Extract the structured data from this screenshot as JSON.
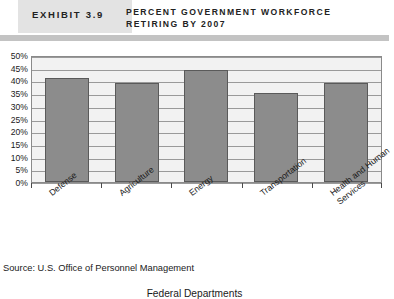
{
  "header": {
    "exhibit_label": "EXHIBIT 3.9",
    "title_line1": "PERCENT GOVERNMENT WORKFORCE",
    "title_line2": "RETIRING BY 2007"
  },
  "source": "Source: U.S. Office of Personnel Management",
  "colors": {
    "bar_fill": "#8c8c8c",
    "bar_border": "#5a5a5a",
    "plot_background": "#f2f2f2",
    "gridline": "#9a9a9a",
    "header_band": "#e3e3e3",
    "header_rule": "#c3c3c3"
  },
  "chart_data": {
    "type": "bar",
    "title": "PERCENT GOVERNMENT WORKFORCE RETIRING BY 2007",
    "categories": [
      "Defense",
      "Agriculture",
      "Energy",
      "Transportation",
      "Health and Human Services"
    ],
    "values": [
      41,
      39,
      44,
      35,
      39
    ],
    "xlabel": "Federal Departments",
    "ylabel": "",
    "ylim": [
      0,
      50
    ],
    "ytick_interval": 5,
    "ytick_labels": [
      "50%",
      "45%",
      "40%",
      "35%",
      "30%",
      "25%",
      "20%",
      "15%",
      "10%",
      "5%",
      "0%"
    ],
    "ytick_values": [
      50,
      45,
      40,
      35,
      30,
      25,
      20,
      15,
      10,
      5,
      0
    ],
    "grid": true,
    "legend": false,
    "legend_position": "none",
    "series": [
      {
        "name": "Percent retiring by 2007",
        "values": [
          41,
          39,
          44,
          35,
          39
        ]
      }
    ]
  }
}
